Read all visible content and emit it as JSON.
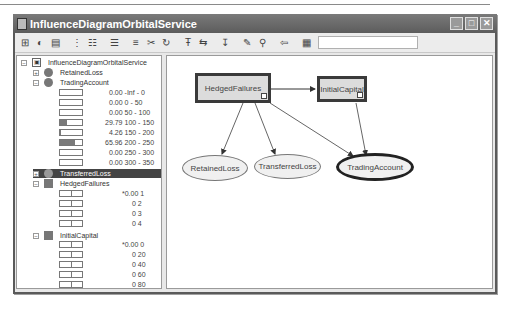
{
  "window": {
    "title": "InfluenceDiagramOrbitalService",
    "controls": [
      "minimize",
      "maximize",
      "close"
    ]
  },
  "toolbar": {
    "icons": [
      "new-network-icon",
      "open-icon",
      "print-icon",
      "layout-icon",
      "grid-icon",
      "list-icon",
      "align-icon",
      "cut-icon",
      "refresh-icon",
      "decision-node-icon",
      "utility-node-icon",
      "arc-icon",
      "edit-icon",
      "find-icon",
      "back-icon",
      "save-icon"
    ],
    "search_value": ""
  },
  "tree": {
    "root": "InfluenceDiagramOrbitalService",
    "nodes": [
      {
        "name": "RetainedLoss",
        "type": "chance",
        "expanded": false
      },
      {
        "name": "TradingAccount",
        "type": "chance",
        "expanded": true,
        "states": [
          {
            "prob": "0.00",
            "label": "-Inf - 0",
            "pct": 0
          },
          {
            "prob": "0.00",
            "label": "0 - 50",
            "pct": 0
          },
          {
            "prob": "0.00",
            "label": "50 - 100",
            "pct": 0
          },
          {
            "prob": "29.79",
            "label": "100 - 150",
            "pct": 29.79
          },
          {
            "prob": "4.26",
            "label": "150 - 200",
            "pct": 4.26
          },
          {
            "prob": "65.96",
            "label": "200 - 250",
            "pct": 65.96
          },
          {
            "prob": "0.00",
            "label": "250 - 300",
            "pct": 0
          },
          {
            "prob": "0.00",
            "label": "300 - 350",
            "pct": 0
          }
        ]
      },
      {
        "name": "TransferredLoss",
        "type": "chance",
        "expanded": false,
        "selected": true
      },
      {
        "name": "HedgedFailures",
        "type": "decision",
        "expanded": true,
        "states": [
          {
            "prob": "*0.00",
            "label": "1"
          },
          {
            "prob": "0",
            "label": "2"
          },
          {
            "prob": "0",
            "label": "3"
          },
          {
            "prob": "0",
            "label": "4"
          }
        ]
      },
      {
        "name": "InitialCapital",
        "type": "decision",
        "expanded": true,
        "states": [
          {
            "prob": "*0.00",
            "label": "0"
          },
          {
            "prob": "0",
            "label": "20"
          },
          {
            "prob": "0",
            "label": "40"
          },
          {
            "prob": "0",
            "label": "60"
          },
          {
            "prob": "0",
            "label": "80"
          },
          {
            "prob": "0",
            "label": "100"
          }
        ]
      }
    ]
  },
  "diagram": {
    "nodes": [
      {
        "id": "HedgedFailures",
        "label": "HedgedFailures",
        "shape": "decision"
      },
      {
        "id": "InitialCapital",
        "label": "InitialCapital",
        "shape": "decision"
      },
      {
        "id": "RetainedLoss",
        "label": "RetainedLoss",
        "shape": "chance"
      },
      {
        "id": "TransferredLoss",
        "label": "TransferredLoss",
        "shape": "chance"
      },
      {
        "id": "TradingAccount",
        "label": "TradingAccount",
        "shape": "chance",
        "highlighted": true
      }
    ],
    "edges": [
      [
        "HedgedFailures",
        "InitialCapital"
      ],
      [
        "HedgedFailures",
        "RetainedLoss"
      ],
      [
        "HedgedFailures",
        "TransferredLoss"
      ],
      [
        "HedgedFailures",
        "TradingAccount"
      ],
      [
        "InitialCapital",
        "TradingAccount"
      ]
    ]
  }
}
